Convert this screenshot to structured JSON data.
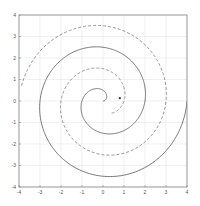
{
  "chart_data": {
    "type": "line",
    "title": "",
    "xlabel": "",
    "ylabel": "",
    "xlim": [
      -4,
      4
    ],
    "ylim": [
      -4,
      4
    ],
    "grid": true,
    "legend": null,
    "x_ticks": [
      -4,
      -3,
      -2,
      -1,
      0,
      1,
      2,
      3,
      4
    ],
    "y_ticks": [
      -4,
      -3,
      -2,
      -1,
      0,
      1,
      2,
      3,
      4
    ],
    "x_tick_labels": [
      "-4",
      "-3",
      "-2",
      "-1",
      "0",
      "1",
      "2",
      "3",
      "4"
    ],
    "y_tick_labels": [
      "-4",
      "-3",
      "-2",
      "-1",
      "0",
      "1",
      "2",
      "3",
      "4"
    ],
    "series": [
      {
        "name": "spiral-solid",
        "style": "solid",
        "color": "#555555",
        "kind": "archimedean_spiral",
        "center": [
          0.0,
          0.0
        ],
        "r_per_radian": 0.3183,
        "theta_start": 0.0,
        "theta_end": 12.566,
        "rotation": 0.0,
        "sample_crossings": {
          "pos_x": [
            2.0,
            4.0
          ],
          "neg_x": [
            -0.9,
            -2.9
          ],
          "pos_y": [
            0.84,
            2.88
          ],
          "neg_y": [
            -1.0,
            -3.1
          ]
        }
      },
      {
        "name": "spiral-dashed",
        "style": "dashed",
        "color": "#777777",
        "kind": "archimedean_spiral",
        "center": [
          0.0,
          0.0
        ],
        "r_per_radian": 0.3183,
        "theta_start": 2.2,
        "theta_end": 12.4,
        "rotation": 3.1416,
        "sample_crossings": {
          "pos_x": [
            1.1,
            3.1
          ],
          "neg_x": [
            -1.75,
            -3.9
          ],
          "pos_y": [
            1.95,
            3.45
          ],
          "neg_y": [
            -2.2
          ]
        }
      }
    ],
    "markers": [
      {
        "name": "center-point",
        "x": 0.8,
        "y": 0.13,
        "shape": "dot",
        "color": "#333333"
      }
    ]
  }
}
